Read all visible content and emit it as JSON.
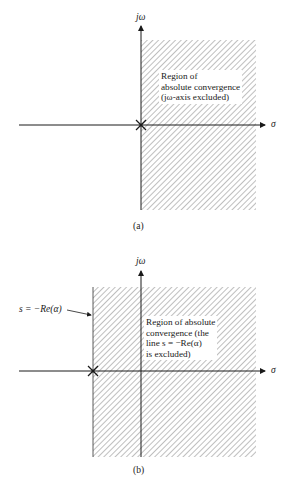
{
  "figure": {
    "panel_a": {
      "axis_y_label": "jω",
      "axis_x_label": "σ",
      "region_text": [
        "Region of",
        "absolute convergence",
        "(jω-axis excluded)"
      ],
      "caption": "(a)",
      "pole_marker": "×",
      "pole_location": "origin"
    },
    "panel_b": {
      "axis_y_label": "jω",
      "axis_x_label": "σ",
      "boundary_label": "s = −Re(α)",
      "region_text": [
        "Region of absolute",
        "convergence (the",
        "line s = −Re(α)",
        "is excluded)"
      ],
      "caption": "(b)",
      "pole_marker": "×",
      "pole_location": "s = −Re(α)"
    },
    "colors": {
      "ink": "#1a1a1a",
      "hatch": "#7a7a7a",
      "background": "#ffffff"
    }
  }
}
